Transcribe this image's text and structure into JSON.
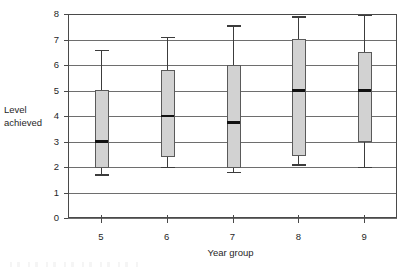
{
  "chart_data": {
    "type": "box",
    "title": "",
    "xlabel": "Year group",
    "ylabel": "Level achieved",
    "ylabel_lines": [
      "Level",
      "achieved"
    ],
    "categories": [
      "5",
      "6",
      "7",
      "8",
      "9"
    ],
    "x_tick_labels": [
      "5",
      "6",
      "7",
      "8",
      "9"
    ],
    "y_tick_labels": [
      "0",
      "1",
      "2",
      "3",
      "4",
      "5",
      "6",
      "7",
      "8"
    ],
    "y_ticks": [
      0,
      1,
      2,
      3,
      4,
      5,
      6,
      7,
      8
    ],
    "ylim": [
      0,
      8
    ],
    "grid": "horizontal",
    "legend": "none",
    "boxes": [
      {
        "category": "5",
        "whisker_low": 1.7,
        "q1": 2.0,
        "median": 3.0,
        "q3": 5.0,
        "whisker_high": 6.6
      },
      {
        "category": "6",
        "whisker_low": 2.0,
        "q1": 2.4,
        "median": 4.0,
        "q3": 5.8,
        "whisker_high": 7.1
      },
      {
        "category": "7",
        "whisker_low": 1.8,
        "q1": 2.0,
        "median": 3.75,
        "q3": 6.0,
        "whisker_high": 7.55
      },
      {
        "category": "8",
        "whisker_low": 2.1,
        "q1": 2.45,
        "median": 5.0,
        "q3": 7.0,
        "whisker_high": 7.9
      },
      {
        "category": "9",
        "whisker_low": 2.0,
        "q1": 3.0,
        "median": 5.0,
        "q3": 6.5,
        "whisker_high": 7.95
      }
    ],
    "colors": {
      "box_fill": "#d2d2d2",
      "box_stroke": "#5a5a5a",
      "median": "#111111",
      "whisker": "#3c3c3c",
      "grid": "#6e6e6e",
      "frame": "#4a4a4a",
      "axis": "#4a4a4a",
      "text": "#1f1f1f",
      "background": "#ffffff"
    },
    "geometry": {
      "plot_left": 68,
      "plot_right": 397,
      "plot_top": 14,
      "plot_bottom": 218,
      "box_width": 13,
      "cap_half_width": 7
    }
  }
}
